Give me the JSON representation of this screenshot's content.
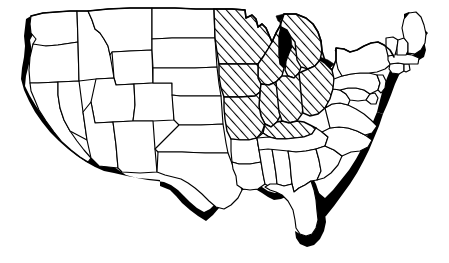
{
  "figure": {
    "region_name": "Midwest",
    "background_color": "#ffffff",
    "line_color": "#000000",
    "shadow_color": "#000000",
    "highlight_fill": "hatched-diagonal"
  },
  "legend": {
    "highlighted_label": "Highlighted states",
    "unhighlighted_label": "Other states",
    "shadow_label": "Coastal drop shadow"
  },
  "highlighted_states": [
    "Minnesota",
    "Wisconsin",
    "Michigan",
    "Iowa",
    "Illinois",
    "Indiana",
    "Ohio",
    "Missouri",
    "Kentucky"
  ],
  "unhighlighted_states": [
    "Washington",
    "Oregon",
    "California",
    "Nevada",
    "Idaho",
    "Montana",
    "Wyoming",
    "Utah",
    "Arizona",
    "Colorado",
    "New Mexico",
    "North Dakota",
    "South Dakota",
    "Nebraska",
    "Kansas",
    "Oklahoma",
    "Texas",
    "Arkansas",
    "Louisiana",
    "Mississippi",
    "Alabama",
    "Tennessee",
    "Georgia",
    "Florida",
    "South Carolina",
    "North Carolina",
    "Virginia",
    "West Virginia",
    "Maryland",
    "Delaware",
    "Pennsylvania",
    "New Jersey",
    "New York",
    "Connecticut",
    "Rhode Island",
    "Massachusetts",
    "Vermont",
    "New Hampshire",
    "Maine"
  ],
  "great_lakes": [
    "Lake Superior",
    "Lake Michigan",
    "Lake Huron",
    "Lake Erie",
    "Lake Ontario"
  ],
  "counts": {
    "highlighted": 9,
    "total_states_shown": 48
  }
}
